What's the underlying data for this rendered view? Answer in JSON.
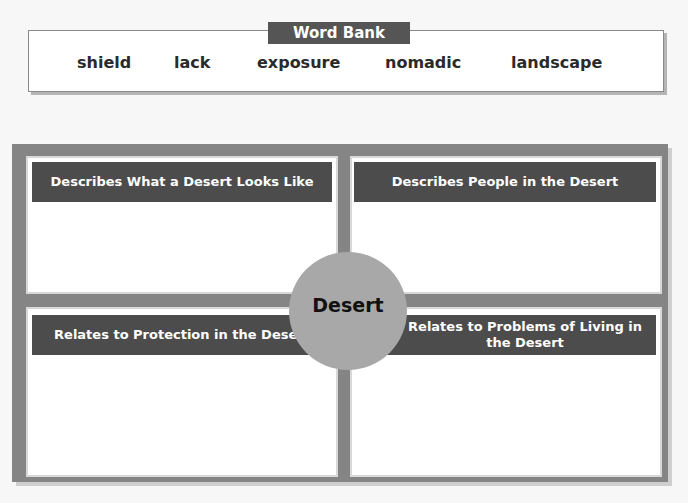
{
  "word_bank": {
    "title": "Word Bank",
    "words": [
      "shield",
      "lack",
      "exposure",
      "nomadic",
      "landscape"
    ]
  },
  "organizer": {
    "center": "Desert",
    "quadrants": [
      {
        "id": "top-left",
        "heading": "Describes What a Desert Looks Like",
        "answer": ""
      },
      {
        "id": "top-right",
        "heading": "Describes People in the Desert",
        "answer": ""
      },
      {
        "id": "bottom-left",
        "heading": "Relates to Protection in the Desert",
        "answer": ""
      },
      {
        "id": "bottom-right",
        "heading": "Relates to Problems of Living in the Desert",
        "answer": ""
      }
    ]
  },
  "colors": {
    "header_bg": "#4c4c4c",
    "frame": "#858585",
    "circle": "#a8a8a8"
  }
}
